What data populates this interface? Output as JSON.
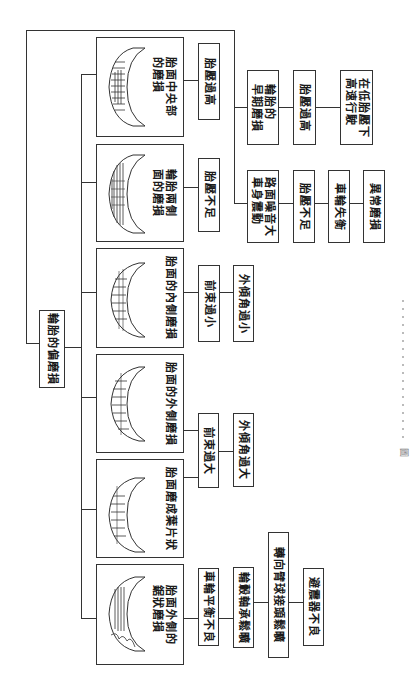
{
  "root": {
    "label": "輪胎的偏磨損"
  },
  "categories": [
    {
      "id": "center",
      "label": "胎面中央部\n的磨損",
      "causes": [
        "胎壓過高"
      ]
    },
    {
      "id": "both-sides",
      "label": "輪胎兩側\n面的磨損",
      "causes": [
        "胎壓不足"
      ]
    },
    {
      "id": "inner",
      "label": "胎面的內側磨損",
      "causes": [
        "前束過小",
        "外傾角過小"
      ]
    },
    {
      "id": "outer",
      "label": "胎面的外側磨損",
      "causes": [
        "前束過大",
        "外傾角過大"
      ]
    },
    {
      "id": "feather",
      "label": "胎面磨成葉片狀",
      "causes_shared_with": "outer"
    },
    {
      "id": "sawtooth",
      "label": "胎面外側的\n鋸狀磨損",
      "causes": [
        "車輪平衡不良",
        "輪轂軸承鬆曠",
        "轉向臂球接頭鬆曠",
        "避震器不良"
      ]
    }
  ],
  "branches": [
    {
      "id": "early-wear",
      "chain": [
        "輪胎的\n早期磨損",
        "胎壓過高",
        "在低胎壓下\n高速行駛"
      ]
    },
    {
      "id": "noise",
      "chain": [
        "路面噪音大\n車身震動",
        "胎壓不足",
        "車輪失衡",
        "異常磨損"
      ]
    }
  ],
  "caption": {
    "prefix": "圖"
  }
}
